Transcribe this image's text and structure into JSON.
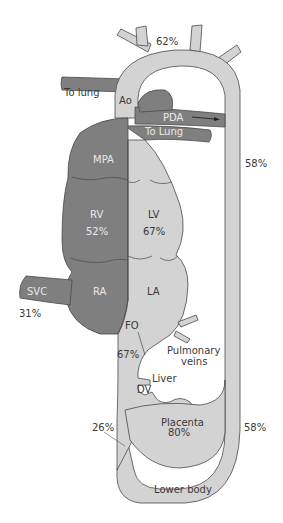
{
  "figure": {
    "colors": {
      "deoxygenated": "#7f7f7f",
      "oxygenated": "#d3d3d3",
      "outline": "#4a4a4a",
      "label_dark": "#3a3a3a",
      "label_light": "#e9e9e9",
      "background": "#ffffff"
    }
  },
  "labels": {
    "aortic_arch_sat": "62%",
    "to_lung_left": "To lung",
    "aorta": "Ao",
    "pda": "PDA",
    "to_lung_right": "To Lung",
    "descending_aorta_sat": "58%",
    "mpa": "MPA",
    "rv": "RV",
    "rv_sat": "52%",
    "lv": "LV",
    "lv_sat": "67%",
    "svc": "SVC",
    "svc_sat": "31%",
    "ra": "RA",
    "la": "LA",
    "fo": "FO",
    "fo_sat": "67%",
    "pulmonary_veins_line1": "Pulmonary",
    "pulmonary_veins_line2": "veins",
    "liver": "Liver",
    "dv": "DV",
    "ivc_sat": "26%",
    "placenta": "Placenta",
    "placenta_sat": "80%",
    "lower_aorta_sat": "58%",
    "lower_body": "Lower body"
  }
}
